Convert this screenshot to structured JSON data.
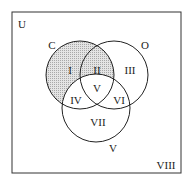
{
  "diagram": {
    "type": "venn",
    "universe_label": "U",
    "sets": [
      {
        "name": "C",
        "label": "C"
      },
      {
        "name": "O",
        "label": "O"
      },
      {
        "name": "V",
        "label": "V"
      }
    ],
    "regions": [
      {
        "id": "I",
        "label": "I",
        "shaded": true
      },
      {
        "id": "II",
        "label": "II",
        "shaded": true
      },
      {
        "id": "III",
        "label": "III",
        "shaded": false
      },
      {
        "id": "IV",
        "label": "IV",
        "shaded": false
      },
      {
        "id": "V",
        "label": "V",
        "shaded": false
      },
      {
        "id": "VI",
        "label": "VI",
        "shaded": false
      },
      {
        "id": "VII",
        "label": "VII",
        "shaded": false
      },
      {
        "id": "VIII",
        "label": "VIII",
        "shaded": false
      }
    ],
    "colors": {
      "shade": "#cfcfcf",
      "stroke": "#222222",
      "background": "#ffffff"
    }
  }
}
